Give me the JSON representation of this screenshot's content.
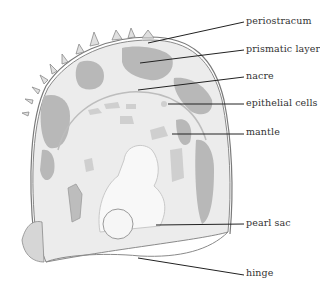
{
  "diagram": {
    "colors": {
      "dark_patch": "#b8b8b8",
      "light_fill": "#e4e4e4",
      "outline": "#8a8a8a",
      "leader": "#222222",
      "text": "#333333"
    },
    "labels": [
      {
        "id": "periostracum",
        "text": "periostracum",
        "x": 246,
        "y": 16,
        "line": [
          148,
          43,
          244,
          22
        ]
      },
      {
        "id": "prismatic-layer",
        "text": "prismatic layer",
        "x": 246,
        "y": 44,
        "line": [
          140,
          63,
          244,
          50
        ]
      },
      {
        "id": "nacre",
        "text": "nacre",
        "x": 246,
        "y": 71,
        "line": [
          138,
          90,
          244,
          77
        ]
      },
      {
        "id": "epithelial-cells",
        "text": "epithelial cells",
        "x": 246,
        "y": 98,
        "line": [
          168,
          104,
          244,
          104
        ]
      },
      {
        "id": "mantle",
        "text": "mantle",
        "x": 246,
        "y": 127,
        "line": [
          172,
          134,
          244,
          134
        ]
      },
      {
        "id": "pearl-sac",
        "text": "pearl sac",
        "x": 246,
        "y": 218,
        "line": [
          156,
          225,
          244,
          224
        ]
      },
      {
        "id": "hinge",
        "text": "hinge",
        "x": 246,
        "y": 268,
        "line": [
          138,
          258,
          244,
          275
        ]
      }
    ]
  }
}
